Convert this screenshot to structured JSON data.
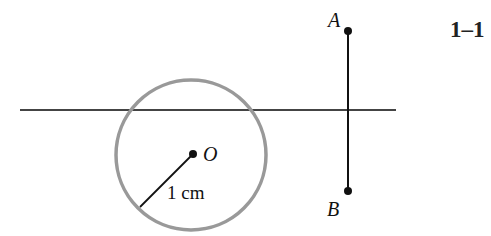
{
  "figure": {
    "number": "1–1",
    "line": {
      "x1": 20,
      "y1": 110,
      "x2": 396,
      "y2": 110,
      "color": "#444444"
    },
    "circle": {
      "cx": 191,
      "cy": 155,
      "r": 75,
      "color": "#999999",
      "center_label": "O"
    },
    "radius_label": "1 cm",
    "segment": {
      "endpoint_top": "A",
      "endpoint_bottom": "B",
      "x": 348,
      "y_top": 31,
      "y_bottom": 191
    }
  }
}
